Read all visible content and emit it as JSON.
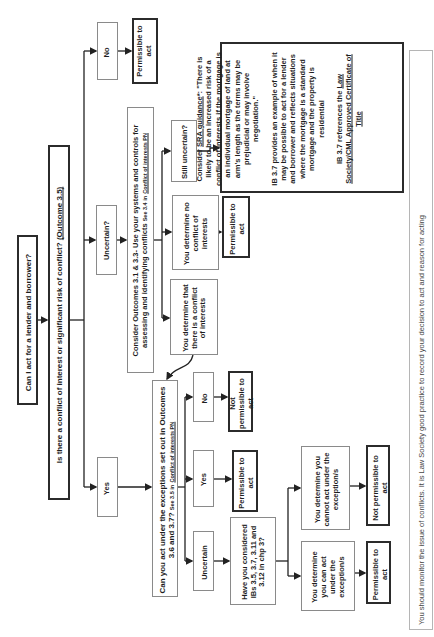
{
  "diagram": {
    "orientation": "rotated 90 degrees counter-clockwise",
    "nodes": {
      "start": {
        "text": "Can I act for a lender and borrower?"
      },
      "conflict_question": {
        "text": "Is there a conflict of interest or significant risk of conflict?",
        "link": "(Outcome 3.5)"
      },
      "answer_no_top": {
        "text": "No"
      },
      "answer_uncertain_top": {
        "text": "Uncertain?"
      },
      "answer_yes_top": {
        "text": "Yes"
      },
      "permissible_top": {
        "text": "Permissible to act"
      },
      "consider_outcomes": {
        "text": "Consider Outcomes 3.1 & 3.3- Use your systems and controls for assessing and identifying conflicts",
        "ref": "See 3.4 in",
        "link": "Conflict of interests PN"
      },
      "still_uncertain": {
        "text": "Still uncertain?"
      },
      "no_conflict": {
        "text": "You determine no conflict of interests"
      },
      "is_conflict": {
        "text": "You determine that there is a conflict of interests"
      },
      "permissible_mid": {
        "text": "Permissible to act"
      },
      "sra_guidance": {
        "para1_prefix": "Consider ",
        "para1_link": "SRA guidance",
        "para1_suffix": "*: \"There is likely to be an increased risk of a conflict of interests if the mortgage is an individual mortgage of land at arm's length as the terms may be prejudicial or may involve negotiation.\"",
        "para2": "IB 3.7 provides an example of when it may be possible to act for a lender and borrower and reflects situations where the mortgage is a standard mortgage and the property is residential",
        "para3_prefix": "IB 3.7 references the ",
        "para3_link": "Law Society/CML Approved Certificate of Title"
      },
      "exceptions_question": {
        "text": "Can you act under the exceptions set out in Outcomes 3.6 and 3.7?",
        "ref": "See 3.5 in",
        "link": "Conflict of interests PN"
      },
      "answer_no_exc": {
        "text": "No"
      },
      "not_permissible_exc": {
        "text": "Not permissible to act"
      },
      "answer_yes_exc": {
        "text": "Yes"
      },
      "permissible_exc": {
        "text": "Permissible to act"
      },
      "answer_uncertain_exc": {
        "text": "Uncertain"
      },
      "considered_ibs": {
        "text": "Have you considered IBs 3.5, 3.7, 3.11 and 3.12 in chp 3?"
      },
      "cannot_act": {
        "text": "You determine you cannot act under the exception/s"
      },
      "can_act": {
        "text": "You determine you can act under the exception/s"
      },
      "not_permissible_final": {
        "text": "Not permissible to act"
      },
      "permissible_final": {
        "text": "Permissible to act"
      },
      "footer_note": {
        "text": "You should monitor the issue of conflicts. It is Law Society good practice to record your decision to act and reason for  acting"
      }
    }
  }
}
